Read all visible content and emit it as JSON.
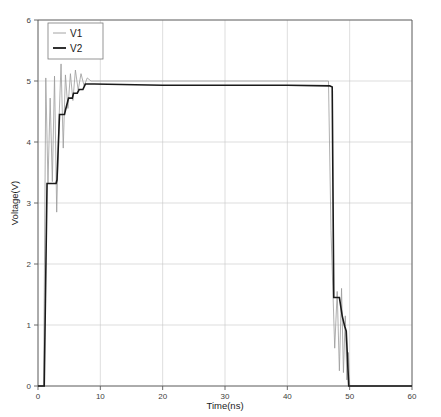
{
  "chart_data": {
    "type": "line",
    "title": "",
    "xlabel": "Time(ns)",
    "ylabel": "Voltage(V)",
    "xlim": [
      0,
      60
    ],
    "ylim": [
      0,
      6
    ],
    "xticks": [
      0,
      10,
      20,
      30,
      40,
      50,
      60
    ],
    "yticks": [
      0,
      1,
      2,
      3,
      4,
      5,
      6
    ],
    "xtick_labels": [
      "0",
      "10",
      "20",
      "30",
      "40",
      "50",
      "60"
    ],
    "ytick_labels": [
      "0",
      "1",
      "2",
      "3",
      "4",
      "5",
      "6"
    ],
    "grid": true,
    "legend_position": "upper left",
    "series": [
      {
        "name": "V1",
        "color": "#9a9a9a",
        "linewidth": 0.8,
        "points": [
          [
            0.0,
            0.0
          ],
          [
            0.9,
            0.0
          ],
          [
            1.25,
            5.05
          ],
          [
            1.6,
            3.32
          ],
          [
            1.95,
            4.72
          ],
          [
            2.3,
            3.35
          ],
          [
            2.65,
            5.08
          ],
          [
            3.0,
            2.85
          ],
          [
            3.35,
            4.3
          ],
          [
            3.7,
            5.28
          ],
          [
            4.05,
            3.9
          ],
          [
            4.4,
            5.1
          ],
          [
            4.8,
            4.55
          ],
          [
            5.2,
            5.12
          ],
          [
            5.6,
            4.68
          ],
          [
            6.0,
            5.18
          ],
          [
            6.45,
            4.85
          ],
          [
            6.9,
            5.12
          ],
          [
            7.4,
            4.92
          ],
          [
            7.9,
            5.05
          ],
          [
            8.5,
            5.0
          ],
          [
            10.0,
            5.0
          ],
          [
            20.0,
            5.0
          ],
          [
            30.0,
            5.0
          ],
          [
            40.0,
            5.0
          ],
          [
            46.0,
            5.0
          ],
          [
            46.6,
            5.0
          ],
          [
            47.0,
            2.55
          ],
          [
            47.6,
            0.62
          ],
          [
            48.0,
            1.55
          ],
          [
            48.35,
            0.25
          ],
          [
            48.7,
            1.6
          ],
          [
            49.0,
            0.22
          ],
          [
            49.3,
            1.15
          ],
          [
            49.55,
            0.1
          ],
          [
            49.8,
            0.55
          ],
          [
            50.0,
            0.0
          ],
          [
            60.0,
            0.0
          ]
        ]
      },
      {
        "name": "V2",
        "color": "#1a1a1a",
        "linewidth": 1.6,
        "points": [
          [
            0.0,
            0.0
          ],
          [
            1.0,
            0.0
          ],
          [
            1.45,
            3.32
          ],
          [
            2.9,
            3.32
          ],
          [
            3.05,
            3.38
          ],
          [
            3.45,
            4.45
          ],
          [
            4.25,
            4.45
          ],
          [
            4.4,
            4.52
          ],
          [
            4.9,
            4.72
          ],
          [
            5.5,
            4.72
          ],
          [
            5.7,
            4.8
          ],
          [
            6.3,
            4.8
          ],
          [
            6.6,
            4.86
          ],
          [
            7.2,
            4.86
          ],
          [
            7.6,
            4.95
          ],
          [
            8.4,
            4.95
          ],
          [
            9.0,
            4.95
          ],
          [
            20.0,
            4.93
          ],
          [
            30.0,
            4.93
          ],
          [
            40.0,
            4.93
          ],
          [
            46.8,
            4.92
          ],
          [
            47.2,
            4.9
          ],
          [
            47.45,
            1.45
          ],
          [
            48.35,
            1.45
          ],
          [
            48.5,
            1.35
          ],
          [
            48.8,
            1.15
          ],
          [
            49.2,
            0.98
          ],
          [
            49.45,
            0.9
          ],
          [
            49.65,
            0.45
          ],
          [
            49.85,
            0.0
          ],
          [
            60.0,
            0.0
          ]
        ]
      }
    ]
  },
  "legend": {
    "entries": [
      {
        "label": "V1"
      },
      {
        "label": "V2"
      }
    ]
  },
  "axes": {
    "x_title": "Time(ns)",
    "y_title": "Voltage(V)"
  }
}
